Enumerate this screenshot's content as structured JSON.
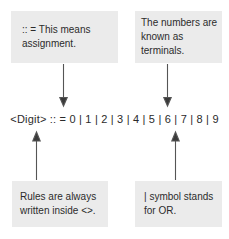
{
  "diagram": {
    "background_color": "#ffffff",
    "callout_fill": "#ebebeb",
    "text_color": "#2b2b2b",
    "arrow_color": "#555555"
  },
  "formula": {
    "text": "<Digit> :: = 0 | 1 | 2 | 3 | 4 | 5 | 6 | 7 | 8 | 9",
    "nonterminal": "<Digit>",
    "assignment_operator": ":: =",
    "alternation_operator": "|",
    "terminals": [
      "0",
      "1",
      "2",
      "3",
      "4",
      "5",
      "6",
      "7",
      "8",
      "9"
    ]
  },
  "callouts": [
    {
      "id": "assignment",
      "text": ":: = This means\nassignment.",
      "position": "top-left",
      "arrow_direction": "down"
    },
    {
      "id": "terminals",
      "text": "The numbers are\nknown as terminals.",
      "position": "top-right",
      "arrow_direction": "down"
    },
    {
      "id": "rules",
      "text": "Rules are always\nwritten inside <>.",
      "position": "bottom-left",
      "arrow_direction": "up"
    },
    {
      "id": "or",
      "text": "| symbol stands\nfor OR.",
      "position": "bottom-right",
      "arrow_direction": "up"
    }
  ]
}
